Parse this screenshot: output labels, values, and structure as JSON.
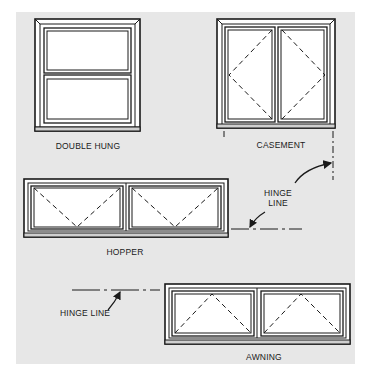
{
  "diagram": {
    "background_color": "#e7e7e7",
    "line_color": "#1a1a1a",
    "windows": [
      {
        "id": "double-hung",
        "label": "DOUBLE HUNG"
      },
      {
        "id": "casement",
        "label": "CASEMENT"
      },
      {
        "id": "hopper",
        "label": "HOPPER"
      },
      {
        "id": "awning",
        "label": "AWNING"
      }
    ],
    "annotations": {
      "hinge_line_hopper": {
        "line1": "HINGE",
        "line2": "LINE"
      },
      "hinge_line_awning": "HINGE LINE"
    }
  }
}
